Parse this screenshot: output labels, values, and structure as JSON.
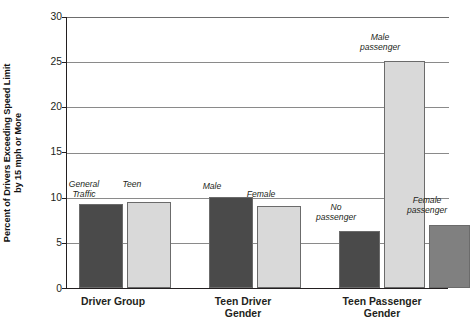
{
  "chart_data": {
    "type": "bar",
    "title": "",
    "xlabel": "",
    "ylabel": "Percent of Drivers Exceeding Speed Limit by 15 mph or More",
    "ylabel_lines": [
      "Percent of Drivers Exceeding Speed Limit",
      "by 15 mph or More"
    ],
    "ylim": [
      0,
      30
    ],
    "yticks": [
      0,
      5,
      10,
      15,
      20,
      25,
      30
    ],
    "ytick_labels": [
      "0",
      "5",
      "10",
      "15",
      "20",
      "25",
      "30"
    ],
    "grid": "horizontal",
    "legend": "none",
    "groups": [
      {
        "name": "Driver Group",
        "label_lines": [
          "Driver Group"
        ],
        "bars": [
          {
            "label": "General Traffic",
            "label_lines": [
              "General",
              "Traffic"
            ],
            "value": 9.3,
            "color": "#4a4a4a"
          },
          {
            "label": "Teen",
            "label_lines": [
              "Teen"
            ],
            "value": 9.5,
            "color": "#d9d9d9"
          }
        ]
      },
      {
        "name": "Teen Driver Gender",
        "label_lines": [
          "Teen Driver",
          "Gender"
        ],
        "bars": [
          {
            "label": "Male",
            "label_lines": [
              "Male"
            ],
            "value": 10.0,
            "color": "#4a4a4a"
          },
          {
            "label": "Female",
            "label_lines": [
              "Female"
            ],
            "value": 9.0,
            "color": "#d9d9d9"
          }
        ]
      },
      {
        "name": "Teen Passenger Gender",
        "label_lines": [
          "Teen Passenger",
          "Gender"
        ],
        "bars": [
          {
            "label": "No passenger",
            "label_lines": [
              "No",
              "passenger"
            ],
            "value": 6.3,
            "color": "#4a4a4a"
          },
          {
            "label": "Male passenger",
            "label_lines": [
              "Male",
              "passenger"
            ],
            "value": 25.0,
            "color": "#d9d9d9"
          },
          {
            "label": "Female passenger",
            "label_lines": [
              "Female",
              "passenger"
            ],
            "value": 7.0,
            "color": "#808080"
          }
        ]
      }
    ],
    "categories": [
      "General Traffic",
      "Teen",
      "Male",
      "Female",
      "No passenger",
      "Male passenger",
      "Female passenger"
    ],
    "values": [
      9.3,
      9.5,
      10.0,
      9.0,
      6.3,
      25.0,
      7.0
    ],
    "colors": {
      "dark": "#4a4a4a",
      "light": "#d9d9d9",
      "medium": "#808080",
      "axis": "#231f20",
      "grid": "#8a8a8a"
    }
  }
}
